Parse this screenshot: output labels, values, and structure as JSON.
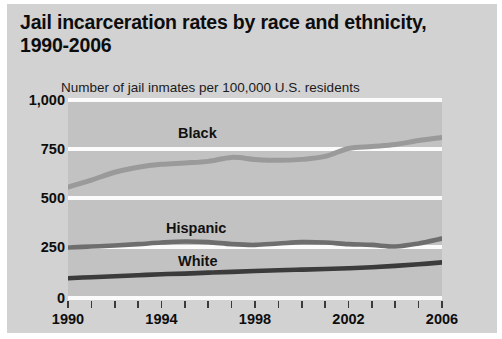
{
  "header": {
    "title": "Jail incarceration rates by race and ethnicity, 1990-2006",
    "subtitle": "Number of jail inmates per 100,000 U.S. residents"
  },
  "colors": {
    "page_background": "#d2d2d2",
    "plot_background": "#c2c2c2",
    "gridline": "#fbfbfb",
    "black_series": "#9a9a9a",
    "hispanic_series": "#6e6e6e",
    "white_series": "#3b3b3b",
    "text": "#0d0d0d"
  },
  "chart_data": {
    "type": "line",
    "title": "Jail incarceration rates by race and ethnicity, 1990-2006",
    "subtitle": "Number of jail inmates per 100,000 U.S. residents",
    "xlabel": "",
    "ylabel": "Number of jail inmates per 100,000 U.S. residents",
    "x": [
      1990,
      1991,
      1992,
      1993,
      1994,
      1995,
      1996,
      1997,
      1998,
      1999,
      2000,
      2001,
      2002,
      2003,
      2004,
      2005,
      2006
    ],
    "xlim": [
      1990,
      2006
    ],
    "ylim": [
      0,
      1000
    ],
    "yticks": [
      0,
      250,
      500,
      750,
      1000
    ],
    "ytick_labels": [
      "0",
      "250",
      "500",
      "750",
      "1,000"
    ],
    "xtick_labels": [
      "1990",
      "1994",
      "1998",
      "2002",
      "2006"
    ],
    "xtick_values": [
      1990,
      1994,
      1998,
      2002,
      2006
    ],
    "grid": true,
    "legend": "inline-labels",
    "series": [
      {
        "name": "Black",
        "color": "#9a9a9a",
        "values": [
          550,
          585,
          625,
          650,
          665,
          672,
          680,
          700,
          690,
          685,
          690,
          705,
          745,
          755,
          765,
          785,
          800
        ]
      },
      {
        "name": "Hispanic",
        "color": "#6e6e6e",
        "values": [
          245,
          250,
          255,
          262,
          270,
          275,
          272,
          262,
          258,
          265,
          272,
          270,
          262,
          258,
          250,
          265,
          290
        ]
      },
      {
        "name": "White",
        "color": "#3b3b3b",
        "values": [
          90,
          95,
          100,
          105,
          110,
          113,
          118,
          122,
          126,
          130,
          133,
          136,
          140,
          145,
          152,
          160,
          170
        ]
      }
    ]
  },
  "axis": {
    "y_labels": [
      "1,000",
      "750",
      "500",
      "250",
      "0"
    ],
    "x_labels": [
      "1990",
      "1994",
      "1998",
      "2002",
      "2006"
    ]
  },
  "series_labels": {
    "black": "Black",
    "hispanic": "Hispanic",
    "white": "White"
  }
}
